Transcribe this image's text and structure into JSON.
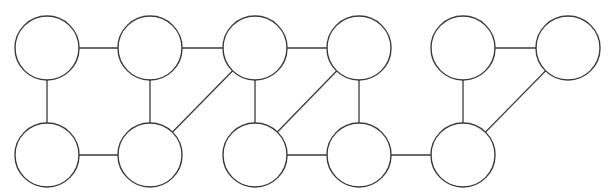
{
  "diagram": {
    "type": "graph",
    "style": {
      "stroke_color": "#3a3a3a",
      "fill_color": "#ffffff",
      "background": "#ffffff"
    },
    "node_radius": 32,
    "nodes": [
      {
        "id": "t1",
        "x": 47,
        "y": 48
      },
      {
        "id": "t2",
        "x": 150,
        "y": 48
      },
      {
        "id": "t3",
        "x": 255,
        "y": 48
      },
      {
        "id": "t4",
        "x": 359,
        "y": 48
      },
      {
        "id": "t5",
        "x": 463,
        "y": 48
      },
      {
        "id": "t6",
        "x": 568,
        "y": 48
      },
      {
        "id": "b1",
        "x": 47,
        "y": 155
      },
      {
        "id": "b2",
        "x": 150,
        "y": 155
      },
      {
        "id": "b3",
        "x": 255,
        "y": 155
      },
      {
        "id": "b4",
        "x": 359,
        "y": 155
      },
      {
        "id": "b5",
        "x": 463,
        "y": 155
      }
    ],
    "edges": [
      [
        "t1",
        "t2"
      ],
      [
        "t2",
        "t3"
      ],
      [
        "t3",
        "t4"
      ],
      [
        "t5",
        "t6"
      ],
      [
        "t1",
        "b1"
      ],
      [
        "t2",
        "b2"
      ],
      [
        "t3",
        "b3"
      ],
      [
        "t4",
        "b4"
      ],
      [
        "t5",
        "b5"
      ],
      [
        "b1",
        "b2"
      ],
      [
        "b3",
        "b4"
      ],
      [
        "b4",
        "b5"
      ],
      [
        "t3",
        "b2"
      ],
      [
        "t4",
        "b3"
      ],
      [
        "t6",
        "b5"
      ]
    ]
  }
}
